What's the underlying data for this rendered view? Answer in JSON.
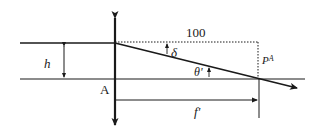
{
  "diagram": {
    "type": "optics-lens-ray",
    "labels": {
      "distance_top": "100",
      "angle_delta": "δ",
      "angle_theta": "θ'",
      "height": "h",
      "point_a": "A",
      "focal_length": "f'",
      "point_p": "P",
      "point_p_sup": "A"
    },
    "colors": {
      "line": "#1a1a1a",
      "background": "#ffffff"
    }
  }
}
